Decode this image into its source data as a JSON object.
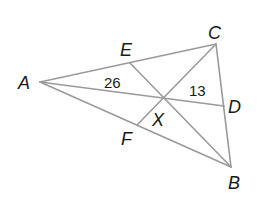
{
  "diagram": {
    "type": "triangle-with-medians",
    "stroke_color": "#9a9a9a",
    "text_color": "#1a1a1a",
    "points": {
      "A": {
        "label": "A",
        "x": 40,
        "y": 82
      },
      "B": {
        "label": "B",
        "x": 231,
        "y": 167
      },
      "C": {
        "label": "C",
        "x": 216,
        "y": 44
      },
      "D": {
        "label": "D",
        "x": 224,
        "y": 106
      },
      "E": {
        "label": "E",
        "x": 130,
        "y": 63
      },
      "F": {
        "label": "F",
        "x": 137,
        "y": 125
      },
      "X": {
        "label": "X",
        "x": 162,
        "y": 98
      }
    },
    "segments": [
      [
        "A",
        "C"
      ],
      [
        "A",
        "B"
      ],
      [
        "C",
        "B"
      ],
      [
        "A",
        "D"
      ],
      [
        "E",
        "B"
      ],
      [
        "F",
        "C"
      ]
    ],
    "measures": [
      {
        "value": "26",
        "segment": "AX"
      },
      {
        "value": "13",
        "segment": "XD"
      }
    ]
  }
}
